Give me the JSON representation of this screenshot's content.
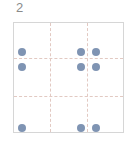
{
  "puzzle": {
    "label": "2",
    "grid": {
      "rows": 3,
      "cols": 3
    },
    "dot_color": "#7f94b3",
    "line_color": "#e2c9c2",
    "border_color": "#d6d6d6",
    "dots": [
      {
        "x": 8,
        "y": 29
      },
      {
        "x": 67,
        "y": 29
      },
      {
        "x": 82,
        "y": 29
      },
      {
        "x": 8,
        "y": 44
      },
      {
        "x": 67,
        "y": 44
      },
      {
        "x": 82,
        "y": 44
      },
      {
        "x": 8,
        "y": 105
      },
      {
        "x": 67,
        "y": 105
      },
      {
        "x": 82,
        "y": 105
      }
    ]
  }
}
